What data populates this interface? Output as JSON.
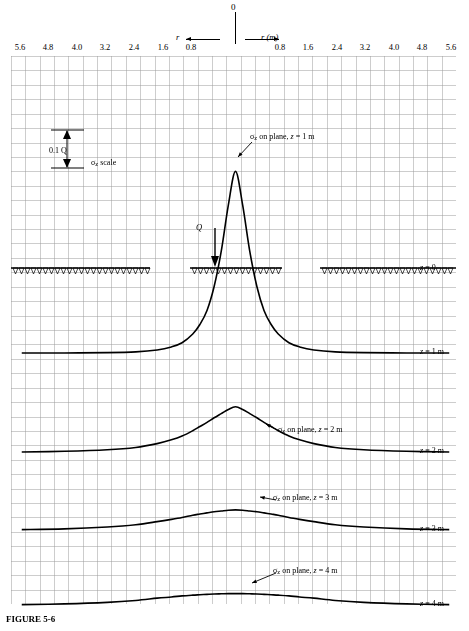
{
  "axis": {
    "origin_label": "0",
    "left_axis_symbol": "r",
    "right_axis_symbol": "r (m)",
    "ticks_left": [
      "5.6",
      "4.8",
      "4.0",
      "3.2",
      "2.4",
      "1.6",
      "0.8"
    ],
    "ticks_right": [
      "0.8",
      "1.6",
      "2.4",
      "3.2",
      "4.0",
      "4.8",
      "5.6"
    ]
  },
  "annotations": {
    "scale_bar": "0.1 Q",
    "scale_label": "σz scale",
    "load_label": "Q",
    "curve1": "σz on plane, z = 1 m",
    "curve2": "σz on plane, z = 2 m",
    "curve3": "σz on plane, z = 3 m",
    "curve4": "σz on plane, z = 4 m",
    "z0": "z = 0",
    "z1": "z = 1 m",
    "z2": "z = 2 m",
    "z3": "z = 3 m",
    "z4": "z = 4 m",
    "figure_caption": "FIGURE 5-6"
  },
  "chart_data": {
    "type": "line",
    "xlabel": "r (m)",
    "ylabel": "σz",
    "xlim": [
      -6.0,
      6.0
    ],
    "grid": true,
    "legend_position": "inline-annotations",
    "scale_reference": {
      "label": "0.1 Q",
      "pixel_height_units": 0.1
    },
    "series": [
      {
        "name": "σz on plane, z = 1 m",
        "depth_m": 1,
        "baseline_y_px": 353,
        "peak_value_rel": 0.4775,
        "x": [
          -6.0,
          -4.8,
          -3.6,
          -2.8,
          -2.2,
          -1.8,
          -1.5,
          -1.2,
          -1.0,
          -0.8,
          -0.6,
          -0.4,
          -0.2,
          0.0,
          0.2,
          0.4,
          0.6,
          0.8,
          1.0,
          1.2,
          1.5,
          1.8,
          2.2,
          2.8,
          3.6,
          4.8,
          6.0
        ],
        "y": [
          0.0,
          0.0,
          0.001,
          0.003,
          0.008,
          0.016,
          0.027,
          0.05,
          0.075,
          0.112,
          0.175,
          0.268,
          0.39,
          0.478,
          0.39,
          0.268,
          0.175,
          0.112,
          0.075,
          0.05,
          0.027,
          0.016,
          0.008,
          0.003,
          0.001,
          0.0,
          0.0
        ]
      },
      {
        "name": "σz on plane, z = 2 m",
        "depth_m": 2,
        "baseline_y_px": 452,
        "peak_value_rel": 0.119,
        "x": [
          -6.0,
          -4.8,
          -3.6,
          -2.8,
          -2.2,
          -1.8,
          -1.5,
          -1.2,
          -1.0,
          -0.8,
          -0.6,
          -0.4,
          -0.2,
          0.0,
          0.2,
          0.4,
          0.6,
          0.8,
          1.0,
          1.2,
          1.5,
          1.8,
          2.2,
          2.8,
          3.6,
          4.8,
          6.0
        ],
        "y": [
          0.0,
          0.002,
          0.006,
          0.012,
          0.022,
          0.032,
          0.042,
          0.056,
          0.067,
          0.078,
          0.09,
          0.101,
          0.112,
          0.119,
          0.112,
          0.101,
          0.09,
          0.078,
          0.067,
          0.056,
          0.042,
          0.032,
          0.022,
          0.012,
          0.006,
          0.002,
          0.0
        ]
      },
      {
        "name": "σz on plane, z = 3 m",
        "depth_m": 3,
        "baseline_y_px": 530,
        "peak_value_rel": 0.053,
        "x": [
          -6.0,
          -4.8,
          -3.6,
          -2.8,
          -2.2,
          -1.8,
          -1.5,
          -1.2,
          -1.0,
          -0.8,
          -0.6,
          -0.4,
          -0.2,
          0.0,
          0.2,
          0.4,
          0.6,
          0.8,
          1.0,
          1.2,
          1.5,
          1.8,
          2.2,
          2.8,
          3.6,
          4.8,
          6.0
        ],
        "y": [
          0.001,
          0.003,
          0.008,
          0.014,
          0.022,
          0.028,
          0.033,
          0.039,
          0.042,
          0.045,
          0.048,
          0.05,
          0.052,
          0.053,
          0.052,
          0.05,
          0.048,
          0.045,
          0.042,
          0.039,
          0.033,
          0.028,
          0.022,
          0.014,
          0.008,
          0.003,
          0.001
        ]
      },
      {
        "name": "σz on plane, z = 4 m",
        "depth_m": 4,
        "baseline_y_px": 605,
        "peak_value_rel": 0.03,
        "x": [
          -6.0,
          -4.8,
          -3.6,
          -2.8,
          -2.2,
          -1.8,
          -1.5,
          -1.2,
          -1.0,
          -0.8,
          -0.6,
          -0.4,
          -0.2,
          0.0,
          0.2,
          0.4,
          0.6,
          0.8,
          1.0,
          1.2,
          1.5,
          1.8,
          2.2,
          2.8,
          3.6,
          4.8,
          6.0
        ],
        "y": [
          0.001,
          0.003,
          0.007,
          0.012,
          0.018,
          0.021,
          0.024,
          0.026,
          0.027,
          0.028,
          0.029,
          0.0295,
          0.03,
          0.03,
          0.03,
          0.0295,
          0.029,
          0.028,
          0.027,
          0.026,
          0.024,
          0.021,
          0.018,
          0.012,
          0.007,
          0.003,
          0.001
        ]
      }
    ]
  }
}
